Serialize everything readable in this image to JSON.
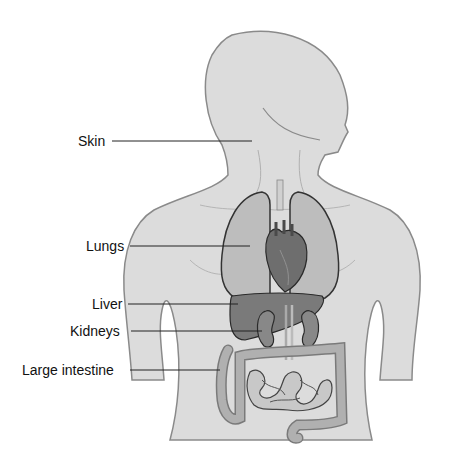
{
  "diagram": {
    "type": "anatomical-illustration",
    "labels": [
      {
        "text": "Skin",
        "x": 78,
        "y": 130,
        "line_end": [
          252,
          141
        ]
      },
      {
        "text": "Lungs",
        "x": 86,
        "y": 236,
        "line_end": [
          250,
          246
        ]
      },
      {
        "text": "Liver",
        "x": 92,
        "y": 297,
        "line_end": [
          238,
          304
        ]
      },
      {
        "text": "Kidneys",
        "x": 70,
        "y": 323,
        "line_end": [
          262,
          331
        ]
      },
      {
        "text": "Large intestine",
        "x": 22,
        "y": 363,
        "line_end": [
          220,
          370
        ]
      }
    ],
    "colors": {
      "skin_fill": "#dcdcdc",
      "skin_outline": "#8a8a8a",
      "organ_outline": "#333333",
      "lung_fill": "#bdbdbd",
      "heart_fill": "#6e6e6e",
      "liver_fill": "#7a7a7a",
      "kidney_fill": "#888888",
      "intestine_fill": "#a8a8a8",
      "leader_line": "#222222"
    }
  }
}
